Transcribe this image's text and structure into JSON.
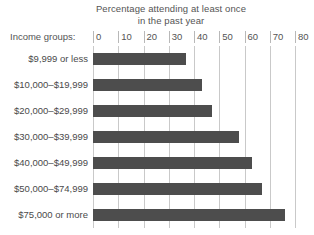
{
  "chart_data": {
    "type": "bar",
    "orientation": "horizontal",
    "title": "Percentage attending at least once in the past year",
    "title_lines": [
      "Percentage attending at least once",
      "in the past year"
    ],
    "axis_caption": "Income groups:",
    "categories": [
      "$9,999 or less",
      "$10,000–$19,999",
      "$20,000–$29,999",
      "$30,000–$39,999",
      "$40,000–$49,999",
      "$50,000–$74,999",
      "$75,000 or more"
    ],
    "values": [
      37,
      43,
      47,
      58,
      63,
      67,
      76
    ],
    "xlabel": "",
    "ylabel": "Income groups:",
    "xlim": [
      0,
      80
    ],
    "xticks": [
      0,
      10,
      20,
      30,
      40,
      50,
      60,
      70,
      80
    ],
    "xtick_labels": [
      "0",
      "10",
      "20",
      "30",
      "40",
      "50",
      "60",
      "70",
      "80"
    ],
    "grid": true,
    "legend": false,
    "bar_color": "#4d4d4d",
    "grid_color": "#c9c9c9",
    "text_color": "#545454"
  }
}
